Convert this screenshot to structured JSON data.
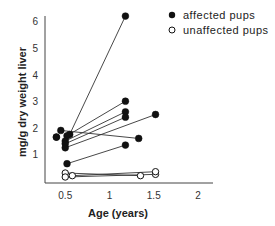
{
  "chart_data": {
    "type": "scatter",
    "title": "",
    "xlabel": "Age (years)",
    "ylabel": "mg/g dry weight liver",
    "xlim": [
      0,
      2.1
    ],
    "ylim": [
      0,
      6.3
    ],
    "xticks": [
      0.5,
      1,
      1.5,
      2
    ],
    "xtick_labels": [
      "0.5",
      "1",
      "1.5",
      "2"
    ],
    "yticks": [
      1,
      2,
      3,
      4,
      5,
      6
    ],
    "ytick_labels": [
      "1",
      "2",
      "3",
      "4",
      "5",
      "6"
    ],
    "grid": false,
    "legend_position": "top-right",
    "series": [
      {
        "name": "affected pups",
        "marker": "filled-circle",
        "color": "#111111",
        "pairs": [
          [
            [
              0.55,
              1.75
            ],
            [
              1.18,
              6.2
            ]
          ],
          [
            [
              0.52,
              1.7
            ],
            [
              1.18,
              3.0
            ]
          ],
          [
            [
              0.5,
              1.5
            ],
            [
              1.18,
              2.6
            ]
          ],
          [
            [
              0.5,
              1.4
            ],
            [
              1.18,
              2.4
            ]
          ],
          [
            [
              0.5,
              1.25
            ],
            [
              1.52,
              2.5
            ]
          ],
          [
            [
              0.45,
              1.9
            ],
            [
              1.33,
              1.6
            ]
          ],
          [
            [
              0.4,
              1.65
            ],
            [
              0.4,
              1.65
            ]
          ],
          [
            [
              0.52,
              0.65
            ],
            [
              1.18,
              1.35
            ]
          ]
        ]
      },
      {
        "name": "unaffected pups",
        "marker": "open-circle",
        "color": "#111111",
        "pairs": [
          [
            [
              0.5,
              0.3
            ],
            [
              1.35,
              0.2
            ]
          ],
          [
            [
              0.5,
              0.15
            ],
            [
              1.52,
              0.25
            ]
          ],
          [
            [
              0.58,
              0.2
            ],
            [
              1.52,
              0.35
            ]
          ]
        ]
      }
    ]
  },
  "legend": {
    "items": [
      {
        "label": "affected pups",
        "marker": "filled"
      },
      {
        "label": "unaffected pups",
        "marker": "open"
      }
    ]
  }
}
